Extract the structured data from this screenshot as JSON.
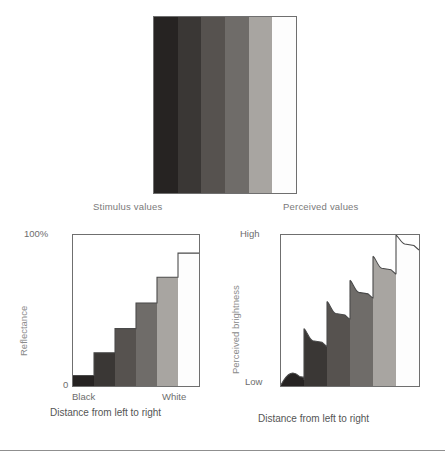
{
  "stimulus_panel": {
    "name": "grayscale-staircase",
    "bands": [
      {
        "label": "band-1",
        "color": "#262322"
      },
      {
        "label": "band-2",
        "color": "#3a3735"
      },
      {
        "label": "band-3",
        "color": "#56524f"
      },
      {
        "label": "band-4",
        "color": "#6f6c69"
      },
      {
        "label": "band-5",
        "color": "#a8a5a1"
      },
      {
        "label": "band-6",
        "color": "#fdfdfd"
      }
    ]
  },
  "captions": {
    "stimulus": "Stimulus values",
    "perceived": "Perceived values"
  },
  "left_chart": {
    "y_max_label": "100%",
    "y_min_label": "0",
    "x_left_label": "Black",
    "x_right_label": "White",
    "y_title": "Reflectance",
    "x_title": "Distance from left to right"
  },
  "right_chart": {
    "y_max_label": "High",
    "y_min_label": "Low",
    "y_title": "Perceived brightness",
    "x_title": "Distance from left to right"
  },
  "chart_data": [
    {
      "type": "bar",
      "id": "reflectance-step-chart",
      "title": "Stimulus values",
      "xlabel": "Distance from left to right",
      "ylabel": "Reflectance",
      "categories": [
        "Black",
        "2",
        "3",
        "4",
        "5",
        "White"
      ],
      "values": [
        7,
        22,
        38,
        55,
        72,
        88
      ],
      "ylim": [
        0,
        100
      ],
      "ytick_labels": [
        "0",
        "100%"
      ],
      "xtick_labels": [
        "Black",
        "White"
      ],
      "grid": false,
      "legend": "none",
      "bar_colors": [
        "#262322",
        "#3a3735",
        "#56524f",
        "#6f6c69",
        "#a8a5a1",
        "#fdfdfd"
      ],
      "notes": "Monotonic staircase of reflectance, equal steps, flat tops."
    },
    {
      "type": "area",
      "id": "perceived-brightness-chart",
      "title": "Perceived values",
      "xlabel": "Distance from left to right",
      "ylabel": "Perceived brightness",
      "categories": [
        "Black",
        "2",
        "3",
        "4",
        "5",
        "White"
      ],
      "values": [
        7,
        30,
        48,
        62,
        78,
        94
      ],
      "overshoot_values": [
        10,
        38,
        56,
        70,
        86,
        100
      ],
      "undershoot_values": [
        4,
        26,
        44,
        58,
        74,
        90
      ],
      "ylim": [
        0,
        100
      ],
      "ytick_labels": [
        "Low",
        "High"
      ],
      "grid": false,
      "legend": "none",
      "bar_colors": [
        "#262322",
        "#3a3735",
        "#56524f",
        "#6f6c69",
        "#a8a5a1",
        "#fdfdfd"
      ],
      "notes": "Mach band profile: each step overshoots at its leading edge then decays to a plateau; first band dips to a rounded blob at the baseline."
    }
  ]
}
